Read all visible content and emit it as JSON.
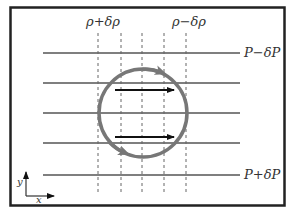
{
  "diagram": {
    "labels": {
      "density_high": "ρ+δρ",
      "density_low": "ρ−δρ",
      "pressure_low": "P−δP",
      "pressure_high": "P+δP",
      "axis_x": "x",
      "axis_y": "y"
    },
    "isobars_y": [
      53,
      83,
      113,
      143,
      175
    ],
    "isopycnals_x": [
      98,
      121,
      142,
      164,
      186
    ],
    "circulation": {
      "cx": 143,
      "cy": 113,
      "r": 44,
      "direction": "clockwise"
    },
    "flow_arrows": [
      "upper-right",
      "lower-right"
    ],
    "colors": {
      "frame": "#222222",
      "lines": "#555555",
      "circle": "#777777",
      "arrows": "#111111"
    }
  }
}
